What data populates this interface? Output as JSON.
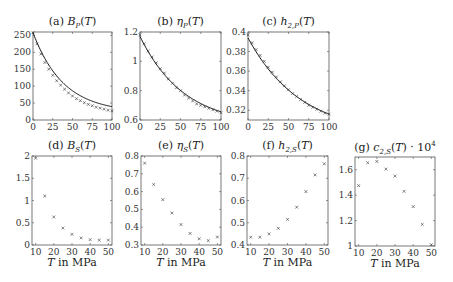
{
  "figure": {
    "x_axis_label_prefix": "T",
    "x_axis_label_suffix": " in MPa"
  },
  "chart_data": [
    {
      "id": "a",
      "type": "line+scatter",
      "title": "(a) B_P(T)",
      "title_prefix": "(a) ",
      "title_main": "B",
      "title_sub": "P",
      "title_tail": "(T)",
      "xlabel": "",
      "ylabel": "",
      "xlim": [
        0,
        100
      ],
      "ylim": [
        0,
        260
      ],
      "xticks": [
        0,
        25,
        50,
        75,
        100
      ],
      "yticks": [
        0,
        50,
        100,
        150,
        200,
        250
      ],
      "frame": {
        "x": 33,
        "y": 32,
        "w": 79,
        "h": 88
      },
      "x": [
        0,
        5,
        10,
        15,
        20,
        25,
        30,
        35,
        40,
        45,
        50,
        55,
        60,
        65,
        70,
        75,
        80,
        85,
        90,
        95,
        100
      ],
      "markers": [
        258,
        225,
        195,
        170,
        150,
        132,
        116,
        103,
        91,
        80,
        71,
        63,
        57,
        51,
        46,
        42,
        38,
        35,
        32,
        29,
        27
      ],
      "curve": {
        "type": "exp",
        "a": 22,
        "b": 236,
        "k": 0.026
      }
    },
    {
      "id": "b",
      "type": "line+scatter",
      "title": "(b) eta_P(T)",
      "title_prefix": "(b) ",
      "title_main": "η",
      "title_sub": "P",
      "title_tail": "(T)",
      "xlim": [
        0,
        100
      ],
      "ylim": [
        0.6,
        1.2
      ],
      "xticks": [
        0,
        25,
        50,
        75,
        100
      ],
      "yticks": [
        0.6,
        0.8,
        1,
        1.2
      ],
      "ytick_labels": [
        "0.6",
        "0.8",
        "1",
        "1.2"
      ],
      "frame": {
        "x": 140,
        "y": 32,
        "w": 81,
        "h": 88
      },
      "x": [
        0,
        5,
        10,
        15,
        20,
        25,
        30,
        35,
        40,
        45,
        50,
        55,
        60,
        65,
        70,
        75,
        80,
        85,
        90,
        95,
        100
      ],
      "markers": [
        1.18,
        1.12,
        1.07,
        1.03,
        0.99,
        0.95,
        0.92,
        0.88,
        0.85,
        0.82,
        0.8,
        0.77,
        0.75,
        0.73,
        0.71,
        0.7,
        0.69,
        0.68,
        0.67,
        0.66,
        0.65
      ],
      "curve": {
        "type": "exp",
        "a": 0.56,
        "b": 0.61,
        "k": 0.0185
      }
    },
    {
      "id": "c",
      "type": "line+scatter",
      "title": "(c) h_2,P(T)",
      "title_prefix": "(c) ",
      "title_main": "h",
      "title_sub": "2,P",
      "title_tail": "(T)",
      "xlim": [
        0,
        100
      ],
      "ylim": [
        0.31,
        0.4
      ],
      "xticks": [
        0,
        25,
        50,
        75,
        100
      ],
      "yticks": [
        0.32,
        0.34,
        0.36,
        0.38,
        0.4
      ],
      "ytick_labels": [
        "0.32",
        "0.34",
        "0.36",
        "0.38",
        "0.4"
      ],
      "frame": {
        "x": 248,
        "y": 32,
        "w": 81,
        "h": 88
      },
      "x": [
        0,
        5,
        10,
        15,
        20,
        25,
        30,
        35,
        40,
        45,
        50,
        55,
        60,
        65,
        70,
        75,
        80,
        85,
        90,
        95,
        100
      ],
      "markers": [
        0.397,
        0.389,
        0.382,
        0.376,
        0.37,
        0.364,
        0.359,
        0.354,
        0.349,
        0.345,
        0.341,
        0.337,
        0.334,
        0.331,
        0.328,
        0.325,
        0.323,
        0.321,
        0.319,
        0.317,
        0.316
      ],
      "curve": {
        "type": "exp",
        "a": 0.295,
        "b": 0.099,
        "k": 0.0155
      }
    },
    {
      "id": "d",
      "type": "scatter",
      "title": "(d) B_S(T)",
      "title_prefix": "(d) ",
      "title_main": "B",
      "title_sub": "S",
      "title_tail": "(T)",
      "xlabel": "T in MPa",
      "xlim": [
        8,
        52
      ],
      "ylim": [
        0,
        2
      ],
      "xticks": [
        10,
        20,
        30,
        40,
        50
      ],
      "yticks": [
        0,
        0.5,
        1,
        1.5,
        2
      ],
      "ytick_labels": [
        "0",
        "0.5",
        "1",
        "1.5",
        "2"
      ],
      "frame": {
        "x": 32,
        "y": 156,
        "w": 80,
        "h": 89
      },
      "x": [
        10,
        15,
        20,
        25,
        30,
        35,
        40,
        45,
        50
      ],
      "markers": [
        1.95,
        1.1,
        0.63,
        0.38,
        0.24,
        0.16,
        0.12,
        0.11,
        0.11
      ]
    },
    {
      "id": "e",
      "type": "scatter",
      "title": "(e) eta_S(T)",
      "title_prefix": "(e) ",
      "title_main": "η",
      "title_sub": "S",
      "title_tail": "(T)",
      "xlabel": "T in MPa",
      "xlim": [
        8,
        52
      ],
      "ylim": [
        0.3,
        0.8
      ],
      "xticks": [
        10,
        20,
        30,
        40,
        50
      ],
      "yticks": [
        0.3,
        0.4,
        0.5,
        0.6,
        0.7,
        0.8
      ],
      "ytick_labels": [
        "0.3",
        "0.4",
        "0.5",
        "0.6",
        "0.7",
        "0.8"
      ],
      "frame": {
        "x": 141,
        "y": 156,
        "w": 80,
        "h": 89
      },
      "x": [
        10,
        15,
        20,
        25,
        30,
        35,
        40,
        45,
        50
      ],
      "markers": [
        0.76,
        0.64,
        0.555,
        0.48,
        0.415,
        0.365,
        0.335,
        0.325,
        0.345
      ]
    },
    {
      "id": "f",
      "type": "scatter",
      "title": "(f) h_2,S(T)",
      "title_prefix": "(f) ",
      "title_main": "h",
      "title_sub": "2,S",
      "title_tail": "(T)",
      "xlabel": "T in MPa",
      "xlim": [
        8,
        52
      ],
      "ylim": [
        0.4,
        0.8
      ],
      "xticks": [
        10,
        20,
        30,
        40,
        50
      ],
      "yticks": [
        0.4,
        0.5,
        0.6,
        0.7,
        0.8
      ],
      "ytick_labels": [
        "0.4",
        "0.5",
        "0.6",
        "0.7",
        "0.8"
      ],
      "frame": {
        "x": 247,
        "y": 156,
        "w": 81,
        "h": 89
      },
      "x": [
        10,
        15,
        20,
        25,
        30,
        35,
        40,
        45,
        50
      ],
      "markers": [
        0.435,
        0.435,
        0.45,
        0.475,
        0.515,
        0.57,
        0.64,
        0.715,
        0.765
      ]
    },
    {
      "id": "g",
      "type": "scatter",
      "title": "(g) c_2,S(T) · 10^4",
      "title_prefix": "(g) ",
      "title_main": "c",
      "title_sub": "2,S",
      "title_tail": "(T) · 10",
      "title_sup": "4",
      "xlabel": "T in MPa",
      "xlim": [
        8,
        52
      ],
      "ylim": [
        1.0,
        1.7
      ],
      "xticks": [
        10,
        20,
        30,
        40,
        50
      ],
      "yticks": [
        1,
        1.2,
        1.4,
        1.6
      ],
      "ytick_labels": [
        "1",
        "1.2",
        "1.4",
        "1.6"
      ],
      "frame": {
        "x": 355,
        "y": 157,
        "w": 80,
        "h": 89
      },
      "x": [
        10,
        15,
        20,
        25,
        30,
        35,
        40,
        45,
        50
      ],
      "markers": [
        1.475,
        1.655,
        1.665,
        1.605,
        1.55,
        1.43,
        1.31,
        1.17,
        1.01
      ]
    }
  ]
}
